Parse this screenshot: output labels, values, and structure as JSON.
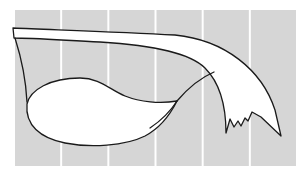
{
  "figure": {
    "background_color": "#d6d6d6",
    "stripe_count": 6,
    "outline_color": "#1a1a1a",
    "fill_color": "#ffffff",
    "parts": [
      {
        "name": "upper-band",
        "label": ""
      },
      {
        "name": "rounded-lobe",
        "label": ""
      },
      {
        "name": "jagged-tail",
        "label": ""
      }
    ]
  }
}
